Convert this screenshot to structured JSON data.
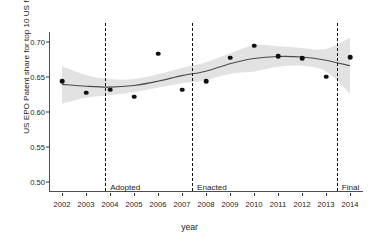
{
  "chart_data": {
    "type": "scatter",
    "title": "",
    "xlabel": "year",
    "ylabel": "US EPO Patent share for top 10 US firms",
    "xlim": [
      2001.4,
      2014.6
    ],
    "ylim": [
      0.485,
      0.715
    ],
    "grid": false,
    "legend": null,
    "x": [
      2002,
      2003,
      2004,
      2005,
      2006,
      2007,
      2008,
      2009,
      2010,
      2011,
      2012,
      2013,
      2014
    ],
    "values": [
      0.6443,
      0.6277,
      0.632,
      0.622,
      0.6833,
      0.6317,
      0.6443,
      0.6777,
      0.695,
      0.6793,
      0.6767,
      0.6507,
      0.678
    ],
    "series": [
      {
        "name": "US EPO Patent share for top 10 US firms",
        "values": [
          0.6443,
          0.6277,
          0.632,
          0.622,
          0.6833,
          0.6317,
          0.6443,
          0.6777,
          0.695,
          0.6793,
          0.6767,
          0.6507,
          0.678
        ]
      },
      {
        "name": "loess fit",
        "values": [
          0.6395,
          0.6368,
          0.6355,
          0.6378,
          0.644,
          0.652,
          0.6583,
          0.669,
          0.6765,
          0.6793,
          0.6785,
          0.674,
          0.666
        ]
      },
      {
        "name": "confidence band upper",
        "values": [
          0.6655,
          0.653,
          0.647,
          0.647,
          0.654,
          0.663,
          0.671,
          0.684,
          0.6955,
          0.694,
          0.6915,
          0.69,
          0.706
        ]
      },
      {
        "name": "confidence band lower",
        "values": [
          0.612,
          0.6205,
          0.624,
          0.6285,
          0.6345,
          0.641,
          0.6455,
          0.6545,
          0.658,
          0.6645,
          0.666,
          0.658,
          0.6265
        ]
      }
    ],
    "ytick_labels": [
      "0.50",
      "0.55",
      "0.60",
      "0.65",
      "0.70"
    ],
    "ytick_values": [
      0.5,
      0.55,
      0.6,
      0.65,
      0.7
    ],
    "xtick_labels": [
      "2002",
      "2003",
      "2004",
      "2005",
      "2006",
      "2007",
      "2008",
      "2009",
      "2010",
      "2011",
      "2012",
      "2013",
      "2014"
    ],
    "xtick_values": [
      2002,
      2003,
      2004,
      2005,
      2006,
      2007,
      2008,
      2009,
      2010,
      2011,
      2012,
      2013,
      2014
    ],
    "annotations": [
      {
        "label": "Adopted",
        "x": 2003.8
      },
      {
        "label": "Enacted",
        "x": 2007.42
      },
      {
        "label": "Final",
        "x": 2013.45
      }
    ],
    "colors": {
      "point": "#111111",
      "fit_line": "#4a4a4a",
      "ribbon": "#e0e0e0",
      "axis": "#4d4d4d",
      "vline": "#111111",
      "background": "#ffffff"
    }
  }
}
